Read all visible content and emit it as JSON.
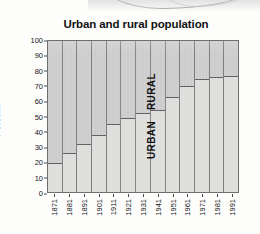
{
  "chart_data": {
    "type": "bar",
    "subtype": "stacked-100-percent",
    "title": "Urban and rural population",
    "xlabel": "",
    "ylabel": "Percent",
    "ylim": [
      0,
      100
    ],
    "yticks": [
      "0",
      "10",
      "20",
      "30",
      "40",
      "50",
      "60",
      "70",
      "80",
      "90",
      "100"
    ],
    "grid": false,
    "legend_position": "in-plot-rotated-labels",
    "categories": [
      "1871",
      "1881",
      "1891",
      "1901",
      "1911",
      "1921",
      "1931",
      "1941",
      "1951",
      "1961",
      "1971",
      "1981",
      "1991"
    ],
    "series": [
      {
        "name": "URBAN",
        "values": [
          19,
          26,
          32,
          38,
          45,
          49,
          52,
          54,
          63,
          70,
          75,
          76,
          77
        ]
      },
      {
        "name": "RURAL",
        "values": [
          81,
          74,
          68,
          62,
          55,
          51,
          48,
          46,
          37,
          30,
          25,
          24,
          23
        ]
      }
    ],
    "annotations": [
      {
        "text": "RURAL",
        "category": "1931",
        "region": "upper"
      },
      {
        "text": "URBAN",
        "category": "1931",
        "region": "lower"
      }
    ],
    "colors": {
      "urban_fill": "#dededc",
      "rural_fill": "#cdcdcd",
      "divider": "#5e5e5e",
      "frame": "#6f6f6f",
      "text": "#121212"
    }
  }
}
